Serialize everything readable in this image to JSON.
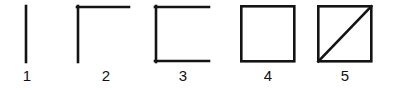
{
  "canvas": {
    "width": 393,
    "height": 90,
    "background_color": "#ffffff",
    "stroke_color": "#141414",
    "stroke_width": 2.6
  },
  "figures": [
    {
      "label": "1",
      "name": "vertical-line",
      "description": "single vertical line segment",
      "segment_count": 1,
      "segments": [
        "left"
      ]
    },
    {
      "label": "2",
      "name": "corner-L-shape",
      "description": "vertical line with horizontal line across the top forming a corner",
      "segment_count": 2,
      "segments": [
        "left",
        "top"
      ]
    },
    {
      "label": "3",
      "name": "open-square-C-shape",
      "description": "square missing its right side",
      "segment_count": 3,
      "segments": [
        "left",
        "top",
        "bottom"
      ]
    },
    {
      "label": "4",
      "name": "closed-square",
      "description": "complete square with all four sides",
      "segment_count": 4,
      "segments": [
        "left",
        "top",
        "bottom",
        "right"
      ]
    },
    {
      "label": "5",
      "name": "square-with-diagonal",
      "description": "complete square with a diagonal from bottom-left to top-right",
      "segment_count": 5,
      "segments": [
        "left",
        "top",
        "bottom",
        "right",
        "diagonal"
      ]
    }
  ]
}
